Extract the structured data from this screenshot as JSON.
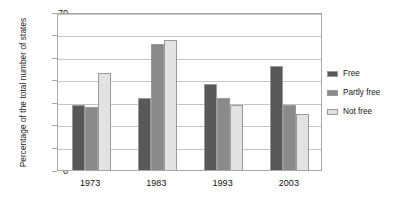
{
  "chart_data": {
    "type": "bar",
    "title": "",
    "subtitle": "",
    "xlabel": "",
    "ylabel": "Percentage of the total number of states",
    "categories": [
      "1973",
      "1983",
      "1993",
      "2003"
    ],
    "series": [
      {
        "name": "Free",
        "values": [
          29,
          32,
          38,
          46
        ],
        "color": "#585858"
      },
      {
        "name": "Partly free",
        "values": [
          28,
          56,
          32,
          29
        ],
        "color": "#8a8a8a"
      },
      {
        "name": "Not free",
        "values": [
          43,
          57.5,
          29,
          25
        ],
        "color": "#e2e2e2"
      }
    ],
    "ylim": [
      0,
      70
    ],
    "yticks": [
      0,
      10,
      20,
      30,
      40,
      50,
      60,
      70
    ],
    "ytick_labels": [
      "0",
      "10",
      "20",
      "30",
      "40",
      "50",
      "60",
      "70"
    ],
    "grid": true,
    "legend_position": "right",
    "annotations": []
  }
}
